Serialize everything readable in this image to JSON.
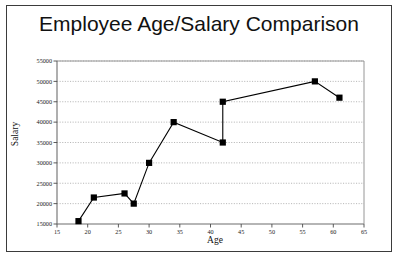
{
  "chart_data": {
    "type": "line",
    "title": "Employee Age/Salary Comparison",
    "xlabel": "Age",
    "ylabel": "Salary",
    "xlim": [
      15,
      65
    ],
    "ylim": [
      15000,
      55000
    ],
    "xticks": [
      15,
      20,
      25,
      30,
      35,
      40,
      45,
      50,
      55,
      60,
      65
    ],
    "yticks": [
      15000,
      20000,
      25000,
      30000,
      35000,
      40000,
      45000,
      50000,
      55000
    ],
    "grid": true,
    "legend": "none",
    "marker": "square",
    "series": [
      {
        "name": "Employees",
        "points": [
          {
            "x": 18.5,
            "y": 15700
          },
          {
            "x": 21.0,
            "y": 21500
          },
          {
            "x": 26.0,
            "y": 22500
          },
          {
            "x": 27.5,
            "y": 20000
          },
          {
            "x": 30.0,
            "y": 30000
          },
          {
            "x": 34.0,
            "y": 40000
          },
          {
            "x": 42.0,
            "y": 35000
          },
          {
            "x": 42.0,
            "y": 45000
          },
          {
            "x": 57.0,
            "y": 50000
          },
          {
            "x": 61.0,
            "y": 46000
          }
        ]
      }
    ]
  },
  "axis": {
    "x_tick_labels": [
      "15",
      "20",
      "25",
      "30",
      "35",
      "40",
      "45",
      "50",
      "55",
      "60",
      "65"
    ],
    "y_tick_labels": [
      "15000",
      "20000",
      "25000",
      "30000",
      "35000",
      "40000",
      "45000",
      "50000",
      "55000"
    ]
  }
}
